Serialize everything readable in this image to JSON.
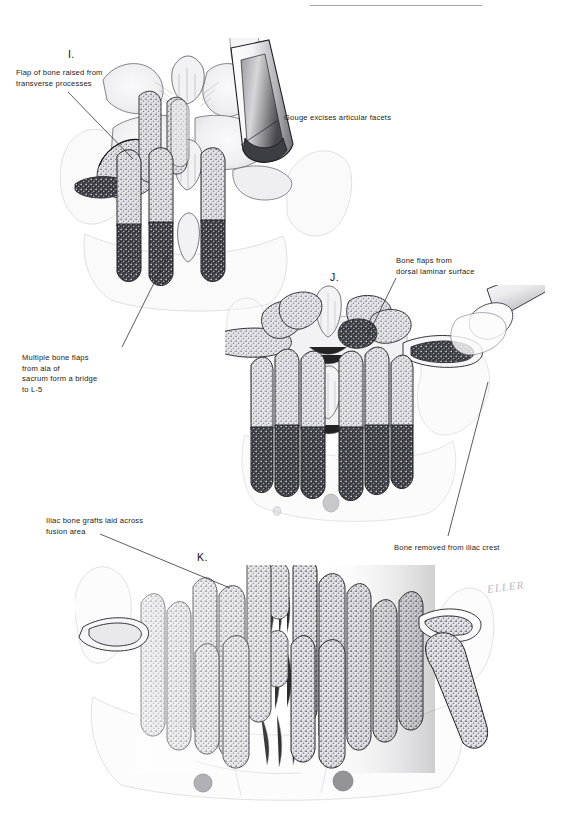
{
  "page": {
    "width": 582,
    "height": 814,
    "background": "#ffffff",
    "ink": "#1b1b20"
  },
  "header": {
    "rule_visible": true,
    "faint_text": ""
  },
  "figure": {
    "signature": "ELLER"
  },
  "panels": [
    {
      "letter": "I.",
      "caption": "Flap of bone raised from transverse processes; gouge excising articular facets"
    },
    {
      "letter": "J.",
      "caption": "Bone flaps raised from the dorsal laminar surface; bone removed from iliac crest"
    },
    {
      "letter": "K.",
      "caption": "Iliac bone grafts laid across the fusion area"
    }
  ],
  "annotations": [
    {
      "id": "flap-of-bone",
      "text": "Flap of bone raised from\ntransverse processes"
    },
    {
      "id": "gouge-excises",
      "text": "Gouge excises articular facets"
    },
    {
      "id": "multiple-bone-flaps",
      "text": "Multiple bone flaps\nfrom ala of\nsacrum form a bridge\nto L-5"
    },
    {
      "id": "bone-flaps-dorsal",
      "text": "Bone flaps from\ndorsal laminar surface"
    },
    {
      "id": "bone-removed-iliac",
      "text": "Bone removed from iliac crest"
    },
    {
      "id": "iliac-bone-grafts",
      "text": "Iliac bone grafts laid across\nfusion area"
    }
  ],
  "colors": {
    "ink": "#1b1b20",
    "rule": "#8a8a8e",
    "graft_fill": "#d9d9dc",
    "graft_dark": "#2b2b2f",
    "bone_tint": "#ededf0",
    "signature": "#b9b9c0"
  }
}
